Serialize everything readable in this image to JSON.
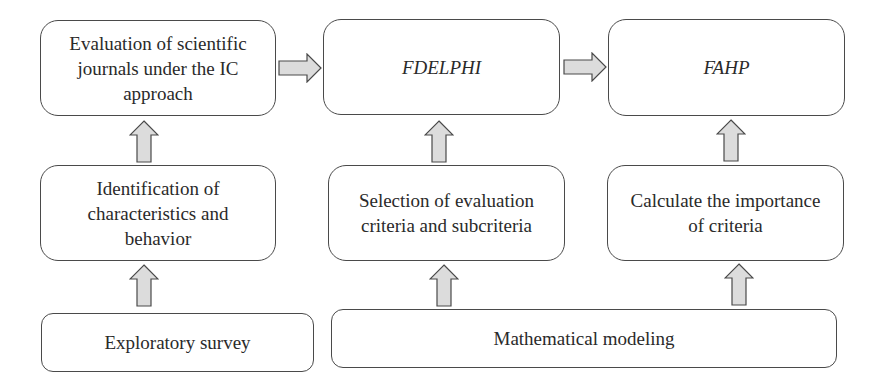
{
  "diagram": {
    "type": "flowchart",
    "nodes": {
      "evaluation": {
        "label": "Evaluation of scientific journals under the IC approach",
        "lines": [
          "Evaluation of scientific",
          "journals under the IC",
          "approach"
        ]
      },
      "fdelphi": {
        "label": "FDELPHI",
        "italic": true
      },
      "fahp": {
        "label": "FAHP",
        "italic": true
      },
      "identification": {
        "label": "Identification of characteristics and behavior",
        "lines": [
          "Identification of",
          "characteristics and",
          "behavior"
        ]
      },
      "selection": {
        "label": "Selection of evaluation criteria and subcriteria",
        "lines": [
          "Selection of evaluation",
          "criteria and subcriteria"
        ]
      },
      "calculate": {
        "label": "Calculate the importance of criteria",
        "lines": [
          "Calculate the importance",
          "of criteria"
        ]
      },
      "exploratory": {
        "label": "Exploratory survey"
      },
      "mathematical": {
        "label": "Mathematical modeling"
      }
    },
    "edges": [
      {
        "from": "evaluation",
        "to": "fdelphi",
        "direction": "right"
      },
      {
        "from": "fdelphi",
        "to": "fahp",
        "direction": "right"
      },
      {
        "from": "identification",
        "to": "evaluation",
        "direction": "up"
      },
      {
        "from": "selection",
        "to": "fdelphi",
        "direction": "up"
      },
      {
        "from": "calculate",
        "to": "fahp",
        "direction": "up"
      },
      {
        "from": "exploratory",
        "to": "identification",
        "direction": "up"
      },
      {
        "from": "mathematical",
        "to": "selection",
        "direction": "up"
      },
      {
        "from": "mathematical",
        "to": "calculate",
        "direction": "up"
      }
    ],
    "colors": {
      "border": "#4a4a4a",
      "arrow_fill": "#dcdcdc",
      "text": "#2a2a2a",
      "background": "#ffffff"
    }
  }
}
